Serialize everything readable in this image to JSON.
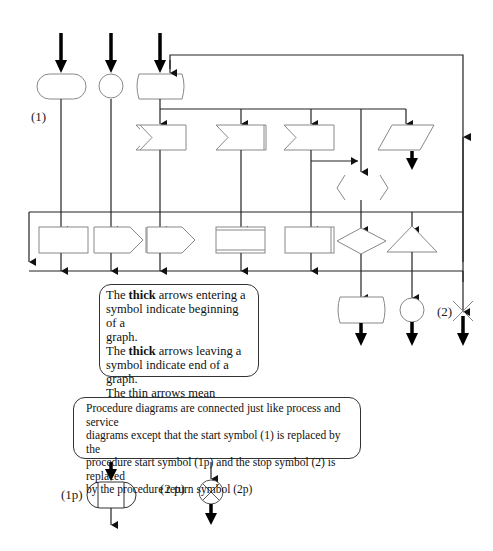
{
  "labels": {
    "start_symbol": "(1)",
    "stop_symbol": "(2)",
    "procedure_start": "(1p)",
    "procedure_return": "(2 p)"
  },
  "note1": {
    "line1_pre": "The ",
    "line1_bold": "thick",
    "line1_post": " arrows  entering a",
    "line2": "symbol indicate beginning of a",
    "line3": "graph.",
    "line4_pre": "The ",
    "line4_bold": "thick",
    "line4_post": " arrows  leaving a",
    "line5": "symbol indicate end of a graph.",
    "line6": "The thin arrows mean",
    "line7": "\"may be followed by\""
  },
  "note2": {
    "line1": "Procedure diagrams are connected just like process and service",
    "line2": "diagrams except that  the start  symbol (1) is replaced by  the",
    "line3": "procedure start symbol (1p) and the stop symbol (2) is replaced",
    "line4": "by the procedure return symbol (2p)"
  },
  "colors": {
    "line": "#222222",
    "symbol_outline": "#888888",
    "background": "#ffffff"
  }
}
